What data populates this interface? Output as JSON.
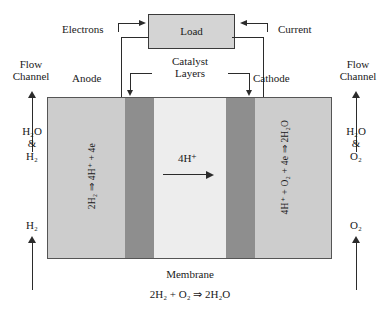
{
  "diagram": {
    "overall_reaction": "2H₂ + O₂ ⇒ 2H₂O",
    "membrane_label": "Membrane",
    "catalyst_label_line1": "Catalyst",
    "catalyst_label_line2": "Layers",
    "load_label": "Load",
    "electrons_label": "Electrons",
    "current_label": "Current",
    "anode_label": "Anode",
    "cathode_label": "Cathode",
    "anode_electron_label": "4e⁻",
    "cathode_electron_label": "4e⁻",
    "proton_label": "4H⁺",
    "anode_reaction": "2H₂ ⇒ 4H⁺ + 4e",
    "cathode_reaction": "4H⁺ + O₂ + 4e ⇒ 2H₂O",
    "left": {
      "flow_channel_line1": "Flow",
      "flow_channel_line2": "Channel",
      "outlet_line1": "H₂O",
      "outlet_line2": "&",
      "outlet_line3": "H₂",
      "inlet": "H₂"
    },
    "right": {
      "flow_channel_line1": "Flow",
      "flow_channel_line2": "Channel",
      "outlet_line1": "H₂O",
      "outlet_line2": "&",
      "outlet_line3": "O₂",
      "inlet": "O₂"
    },
    "colors": {
      "gas_diffusion_layer": "#cdcdcd",
      "catalyst_layer": "#8e8e8e",
      "membrane": "#ededed",
      "load_fill": "#d4d4d4",
      "line": "#2b2b2b",
      "text": "#1a1a1a",
      "background": "#ffffff"
    }
  }
}
